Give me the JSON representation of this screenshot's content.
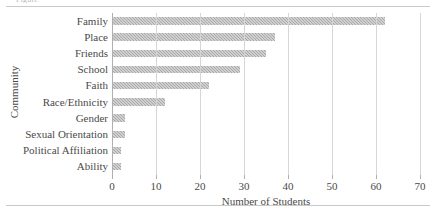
{
  "figure": {
    "top_fragment": "Figure",
    "background_color": "#ffffff",
    "bar_color": "#a9a9a9",
    "gridline_color": "#d6d6d6",
    "axis_color": "#b0b0b0",
    "text_color": "#4a4a4a"
  },
  "chart_data": {
    "type": "bar",
    "orientation": "horizontal",
    "title": "",
    "xlabel": "Number of Students",
    "ylabel": "Community",
    "xlim": [
      0,
      70
    ],
    "xticks": [
      0,
      10,
      20,
      30,
      40,
      50,
      60,
      70
    ],
    "grid": true,
    "legend": null,
    "categories": [
      "Family",
      "Place",
      "Friends",
      "School",
      "Faith",
      "Race/Ethnicity",
      "Gender",
      "Sexual Orientation",
      "Political Affiliation",
      "Ability"
    ],
    "values": [
      62,
      37,
      35,
      29,
      22,
      12,
      3,
      3,
      2,
      2
    ]
  }
}
